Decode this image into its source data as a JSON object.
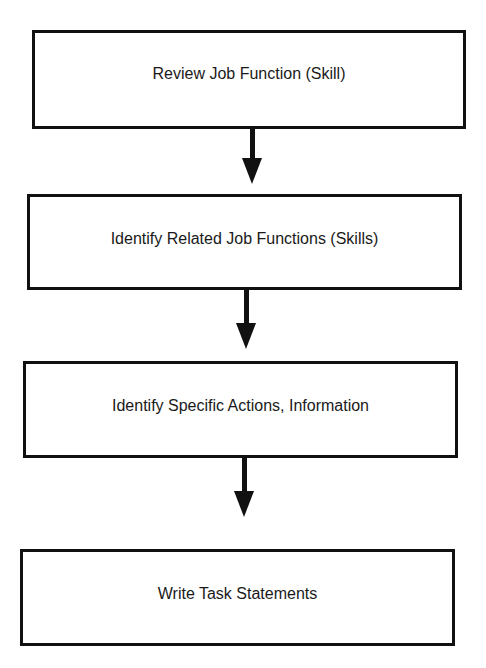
{
  "flowchart": {
    "steps": [
      {
        "label": "Review Job Function (Skill)"
      },
      {
        "label": "Identify Related Job Functions (Skills)"
      },
      {
        "label": "Identify Specific Actions, Information"
      },
      {
        "label": "Write Task Statements"
      }
    ],
    "colors": {
      "stroke": "#111111",
      "background": "#ffffff",
      "text": "#1a1a1a"
    }
  }
}
